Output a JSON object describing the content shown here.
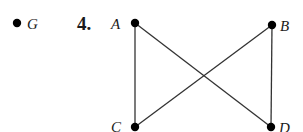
{
  "problem_number": "4.",
  "isolated_vertex": {
    "label": "G",
    "x": 17,
    "y": 23
  },
  "vertices": [
    {
      "id": "A",
      "label": "A",
      "x": 135,
      "y": 23
    },
    {
      "id": "B",
      "label": "B",
      "x": 272,
      "y": 25
    },
    {
      "id": "C",
      "label": "C",
      "x": 135,
      "y": 127
    },
    {
      "id": "D",
      "label": "D",
      "x": 271,
      "y": 127
    }
  ],
  "edges": [
    [
      "A",
      "C"
    ],
    [
      "A",
      "D"
    ],
    [
      "B",
      "C"
    ],
    [
      "B",
      "D"
    ]
  ],
  "colors": {
    "ink": "#000000",
    "edge": "#333333"
  }
}
